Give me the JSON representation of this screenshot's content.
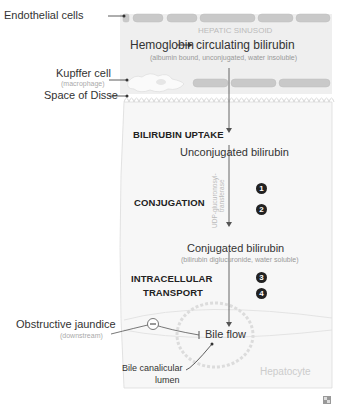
{
  "labels": {
    "endothelial_cells": "Endothelial cells",
    "kupffer_cell": "Kupffer cell",
    "kupffer_sub": "(macrophage)",
    "space_of_disse": "Space of Disse",
    "obstructive_jaundice": "Obstructive jaundice",
    "obstructive_sub": "(downstream)",
    "bile_canalicular_1": "Bile canalicular",
    "bile_canalicular_2": "lumen"
  },
  "sinusoid": {
    "title": "HEPATIC SINUSOID",
    "hemoglobin": "Hemoglobin",
    "circulating": "circulating bilirubin",
    "circulating_sub": "(albumin bound, unconjugated, water insoluble)"
  },
  "steps": {
    "uptake": "BILIRUBIN UPTAKE",
    "unconjugated": "Unconjugated bilirubin",
    "conjugation": "CONJUGATION",
    "enzyme_1": "UDP-glucuronosyl-",
    "enzyme_2": "transferase",
    "badge1": "1",
    "badge2": "2",
    "conjugated": "Conjugated bilirubin",
    "conjugated_sub": "(bilirubin diglucuronide, water soluble)",
    "transport_1": "INTRACELLULAR",
    "transport_2": "TRANSPORT",
    "badge3": "3",
    "badge4": "4",
    "bile_flow": "Bile flow",
    "inhibit_symbol": "−",
    "hepatocyte": "Hepatocyte"
  },
  "colors": {
    "sinusoid_bg": "#efefef",
    "hepatocyte_bg": "#f6f6f6",
    "cell_fill": "#c8c8c8",
    "outline": "#d0d0d0",
    "arrow": "#555555",
    "badge": "#222222"
  }
}
